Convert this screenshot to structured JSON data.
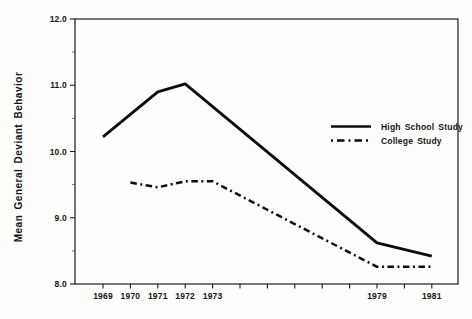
{
  "figure": {
    "background": "#fdfdfb",
    "ink_color": "#151515"
  },
  "chart_data": {
    "type": "line",
    "title": "",
    "xlabel": "",
    "ylabel": "Mean General Deviant Behavior",
    "ylim": [
      8.0,
      12.0
    ],
    "y_major_ticks": [
      12.0,
      11.0,
      10.0,
      9.0,
      8.0
    ],
    "y_tick_labels": [
      "12.0",
      "11.0",
      "10.0",
      "9.0",
      "8.0"
    ],
    "y_minor_ticks": [
      11.5,
      10.5,
      9.5,
      8.5
    ],
    "x_ticks": [
      1969,
      1970,
      1971,
      1972,
      1973,
      1974,
      1975,
      1976,
      1977,
      1978,
      1979,
      1980,
      1981
    ],
    "x_labeled_ticks": [
      1969,
      1970,
      1971,
      1972,
      1973,
      1979,
      1981
    ],
    "grid": false,
    "legend_position": "inside-right",
    "series": [
      {
        "name": "High School Study",
        "line_style": "solid",
        "points": [
          [
            1969,
            10.22
          ],
          [
            1971,
            10.9
          ],
          [
            1972,
            11.02
          ],
          [
            1979,
            8.62
          ],
          [
            1981,
            8.42
          ]
        ]
      },
      {
        "name": "College Study",
        "line_style": "dash-dot",
        "points": [
          [
            1970,
            9.53
          ],
          [
            1971,
            9.46
          ],
          [
            1972,
            9.55
          ],
          [
            1973,
            9.55
          ],
          [
            1979,
            8.26
          ],
          [
            1981,
            8.26
          ]
        ]
      }
    ]
  }
}
